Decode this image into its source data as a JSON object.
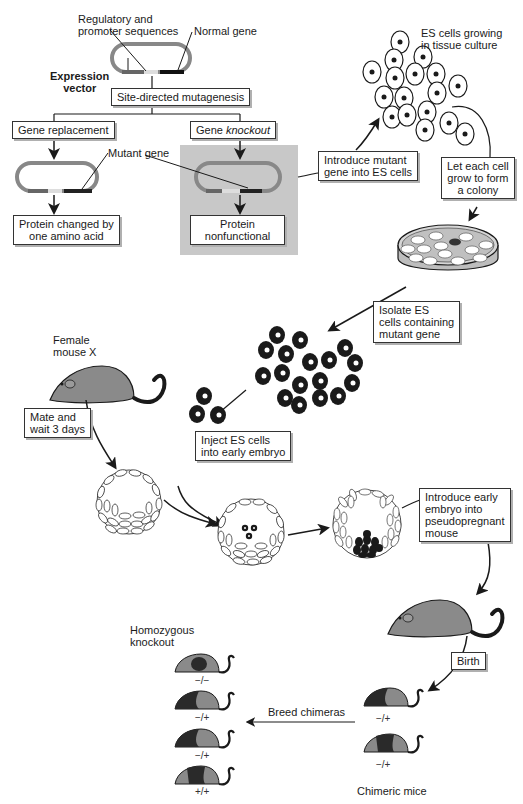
{
  "diagram": {
    "labels": {
      "regulatory": [
        "Regulatory and",
        "promoter sequences"
      ],
      "normal_gene": "Normal gene",
      "expression_vector": [
        "Expression",
        "vector"
      ],
      "mutant_gene": "Mutant gene",
      "es_growing": [
        "ES cells growing",
        "in tissue culture"
      ],
      "female_mouse": [
        "Female",
        "mouse X"
      ],
      "homozygous": [
        "Homozygous",
        "knockout"
      ],
      "chimeric_mice": "Chimeric mice"
    },
    "boxes": {
      "site_directed": "Site-directed mutagenesis",
      "gene_replacement": "Gene replacement",
      "gene_knockout_prefix": "Gene ",
      "gene_knockout_italic": "knockout",
      "protein_changed": [
        "Protein changed by",
        "one amino acid"
      ],
      "protein_nonfunctional": [
        "Protein",
        "nonfunctional"
      ],
      "introduce_mutant": [
        "Introduce mutant",
        "gene into ES cells"
      ],
      "let_each_cell": [
        "Let each cell",
        "grow to form",
        "a colony"
      ],
      "isolate_es": [
        "Isolate ES",
        "cells containing",
        "mutant gene"
      ],
      "mate_wait": [
        "Mate and",
        "wait 3 days"
      ],
      "inject_es": [
        "Inject ES cells",
        "into early embryo"
      ],
      "introduce_embryo": [
        "Introduce early",
        "embryo into",
        "pseudopregnant",
        "mouse"
      ],
      "birth": "Birth",
      "breed_chimeras": "Breed chimeras"
    },
    "genotypes": {
      "offspring": [
        "−/−",
        "−/+",
        "−/+",
        "+/+"
      ],
      "chimeras": [
        "−/+",
        "−/+"
      ]
    },
    "colors": {
      "ink": "#1a1a1a",
      "mouse_gray": "#8a8a8a",
      "mouse_dark": "#2a2a2a",
      "knockout_panel": "#c8c8c8",
      "box_shadow": "#b0b0b0"
    }
  }
}
